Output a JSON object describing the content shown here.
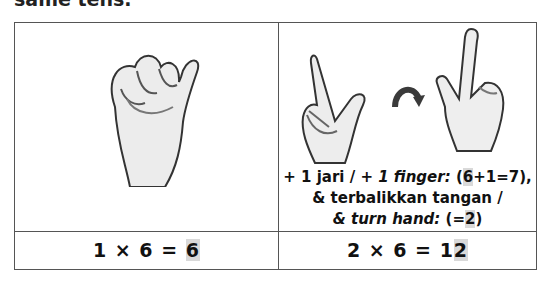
{
  "heading_fragment": "same tens.",
  "table": {
    "row1": {
      "left": {
        "image": "closed-fist-thumb-up-hand"
      },
      "right": {
        "images": [
          "hand-index-and-thumb-extended",
          "curved-arrow-flip-icon",
          "hand-turned-index-up"
        ],
        "caption": {
          "line1_prefix": "+ 1 jari / ",
          "line1_italic": "+ 1 finger:",
          "line1_open": " (",
          "line1_hl": "6",
          "line1_rest": "+1=7),",
          "line2": "& terbalikkan tangan /",
          "line3_italic": "& turn hand:",
          "line3_open": " (=",
          "line3_hl": "2",
          "line3_close": ")"
        }
      }
    },
    "row2": {
      "left": {
        "eq_prefix": "1 × 6 = ",
        "eq_hl": "6"
      },
      "right": {
        "eq_prefix": "2 × 6 = 1",
        "eq_hl": "2"
      }
    }
  },
  "colors": {
    "border": "#555555",
    "highlight": "#d9d9d9",
    "arrow": "#3a3a3a"
  }
}
